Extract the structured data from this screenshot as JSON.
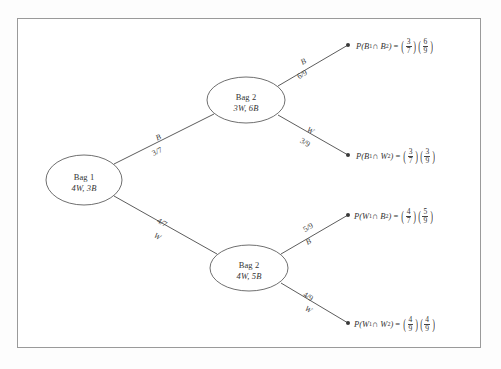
{
  "diagram": {
    "type": "probability-tree",
    "border_color": "#9a9a9a",
    "line_color": "#4a4a4a",
    "nodes": {
      "root": {
        "name": "Bag 1",
        "contents": "4W, 3B",
        "white": 4,
        "black": 3
      },
      "upper": {
        "name": "Bag 2",
        "contents": "3W, 6B",
        "white": 3,
        "black": 6
      },
      "lower": {
        "name": "Bag 2",
        "contents": "4W, 5B",
        "white": 4,
        "black": 5
      }
    },
    "branches": {
      "root_upper": {
        "outcome": "B",
        "prob": "3/7",
        "num": 3,
        "den": 7
      },
      "root_lower": {
        "outcome": "W",
        "prob": "4/7",
        "num": 4,
        "den": 7
      },
      "upper_upper": {
        "outcome": "B",
        "prob": "6/9",
        "num": 6,
        "den": 9
      },
      "upper_lower": {
        "outcome": "W",
        "prob": "3/9",
        "num": 3,
        "den": 9
      },
      "lower_upper": {
        "outcome": "B",
        "prob": "5/9",
        "num": 5,
        "den": 9
      },
      "lower_lower": {
        "outcome": "W",
        "prob": "4/9",
        "num": 4,
        "den": 9
      }
    },
    "outcomes": [
      {
        "id": "bb",
        "event_base": "P(B",
        "event_sub1": "1",
        "event_mid": " ∩ B",
        "event_sub2": "2",
        "event_end": ")",
        "equals": "=",
        "f1_num": "3",
        "f1_den": "7",
        "f2_num": "6",
        "f2_den": "9"
      },
      {
        "id": "bw",
        "event_base": "P(B",
        "event_sub1": "1",
        "event_mid": " ∩ W",
        "event_sub2": "2",
        "event_end": ")",
        "equals": "=",
        "f1_num": "3",
        "f1_den": "7",
        "f2_num": "3",
        "f2_den": "9"
      },
      {
        "id": "wb",
        "event_base": "P(W",
        "event_sub1": "1",
        "event_mid": " ∩ B",
        "event_sub2": "2",
        "event_end": ")",
        "equals": "=",
        "f1_num": "4",
        "f1_den": "7",
        "f2_num": "5",
        "f2_den": "9"
      },
      {
        "id": "ww",
        "event_base": "P(W",
        "event_sub1": "1",
        "event_mid": " ∩ W",
        "event_sub2": "2",
        "event_end": ")",
        "equals": "=",
        "f1_num": "4",
        "f1_den": "9",
        "f2_num": "4",
        "f2_den": "9"
      }
    ]
  }
}
